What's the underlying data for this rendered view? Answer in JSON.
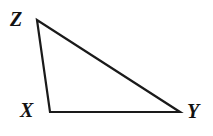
{
  "figure": {
    "kind": "geometry-diagram",
    "shape": "triangle",
    "background_color": "#ffffff",
    "stroke_color": "#1a1a1a",
    "stroke_width": 2.2,
    "width": 213,
    "height": 136,
    "vertices": [
      {
        "id": "Z",
        "label": "Z",
        "x": 37,
        "y": 20
      },
      {
        "id": "X",
        "label": "X",
        "x": 50,
        "y": 112
      },
      {
        "id": "Y",
        "label": "Y",
        "x": 180,
        "y": 112
      }
    ],
    "edges": [
      {
        "id": "ZX",
        "from": "Z",
        "to": "X"
      },
      {
        "id": "XY",
        "from": "X",
        "to": "Y"
      },
      {
        "id": "YZ",
        "from": "Y",
        "to": "Z"
      }
    ],
    "labels": {
      "z": "Z",
      "x": "X",
      "y": "Y"
    }
  }
}
